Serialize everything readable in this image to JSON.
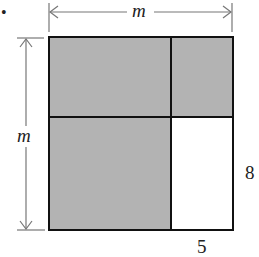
{
  "diagram": {
    "bullet": "•",
    "top_label": "m",
    "left_label": "m",
    "right_label": "8",
    "bottom_label": "5",
    "colors": {
      "shade": "#b3b3b3",
      "border": "#111111",
      "arrow": "#777777",
      "background": "#ffffff"
    },
    "regions": [
      {
        "name": "top-left",
        "shaded": true
      },
      {
        "name": "top-right",
        "shaded": true
      },
      {
        "name": "bottom-left",
        "shaded": true
      },
      {
        "name": "bottom-right",
        "shaded": false,
        "width": "5",
        "height": "8"
      }
    ]
  }
}
